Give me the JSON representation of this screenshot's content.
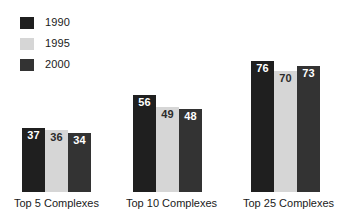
{
  "chart_data": {
    "type": "bar",
    "title": "",
    "xlabel": "",
    "ylabel": "",
    "ylim": [
      0,
      80
    ],
    "grid": false,
    "legend_position": "top-left",
    "categories": [
      "Top 5 Complexes",
      "Top 10 Complexes",
      "Top 25 Complexes"
    ],
    "series": [
      {
        "name": "1990",
        "color": "#1f1f1f",
        "label_color": "#ffffff",
        "values": [
          37,
          56,
          76
        ]
      },
      {
        "name": "1995",
        "color": "#d6d6d6",
        "label_color": "#2b2b2b",
        "values": [
          36,
          49,
          70
        ]
      },
      {
        "name": "2000",
        "color": "#333333",
        "label_color": "#ffffff",
        "values": [
          34,
          48,
          73
        ]
      }
    ]
  },
  "legend": {
    "items": [
      {
        "label": "1990",
        "color": "#1f1f1f"
      },
      {
        "label": "1995",
        "color": "#d6d6d6"
      },
      {
        "label": "2000",
        "color": "#333333"
      }
    ]
  }
}
